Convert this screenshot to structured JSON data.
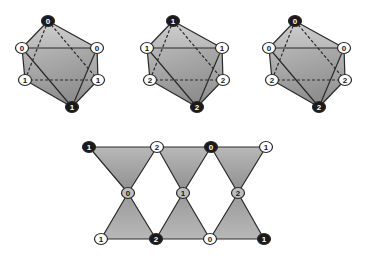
{
  "colors": {
    "background": "#ffffff",
    "edge": "#2a2a2a",
    "face_light": "#c9c9c9",
    "face_mid": "#a8a8a8",
    "face_dark": "#858585",
    "node_black": "#1a1a1a",
    "node_white": "#ffffff",
    "node_gray": "#bdbdbd"
  },
  "octahedra": [
    {
      "name": "octahedron-1",
      "offset_x": 0,
      "vertices": {
        "top": {
          "label": "0",
          "style": "black",
          "x": 48,
          "y": 21
        },
        "upper_left": {
          "label": "0",
          "style": "white",
          "x": 22,
          "y": 48
        },
        "upper_right": {
          "label": "0",
          "style": "white",
          "x": 97,
          "y": 48
        },
        "lower_left": {
          "label": "1",
          "style": "white",
          "x": 25,
          "y": 80
        },
        "lower_right": {
          "label": "1",
          "style": "white",
          "x": 98,
          "y": 80
        },
        "bottom": {
          "label": "1",
          "style": "black",
          "x": 72,
          "y": 107
        }
      }
    },
    {
      "name": "octahedron-2",
      "offset_x": 125,
      "vertices": {
        "top": {
          "label": "1",
          "style": "black",
          "x": 48,
          "y": 21
        },
        "upper_left": {
          "label": "1",
          "style": "white",
          "x": 22,
          "y": 48
        },
        "upper_right": {
          "label": "1",
          "style": "white",
          "x": 97,
          "y": 48
        },
        "lower_left": {
          "label": "2",
          "style": "white",
          "x": 25,
          "y": 80
        },
        "lower_right": {
          "label": "2",
          "style": "white",
          "x": 98,
          "y": 80
        },
        "bottom": {
          "label": "2",
          "style": "black",
          "x": 72,
          "y": 107
        }
      }
    },
    {
      "name": "octahedron-3",
      "offset_x": 247,
      "vertices": {
        "top": {
          "label": "0",
          "style": "black",
          "x": 48,
          "y": 21
        },
        "upper_left": {
          "label": "0",
          "style": "white",
          "x": 22,
          "y": 48
        },
        "upper_right": {
          "label": "0",
          "style": "white",
          "x": 97,
          "y": 48
        },
        "lower_left": {
          "label": "2",
          "style": "white",
          "x": 25,
          "y": 80
        },
        "lower_right": {
          "label": "2",
          "style": "white",
          "x": 98,
          "y": 80
        },
        "bottom": {
          "label": "2",
          "style": "black",
          "x": 72,
          "y": 107
        }
      }
    }
  ],
  "chain": {
    "name": "bowtie-chain",
    "top_row": [
      {
        "label": "1",
        "style": "black",
        "x": 89,
        "y": 147
      },
      {
        "label": "2",
        "style": "white",
        "x": 157,
        "y": 147
      },
      {
        "label": "0",
        "style": "black",
        "x": 211,
        "y": 147
      },
      {
        "label": "1",
        "style": "white",
        "x": 266,
        "y": 147
      }
    ],
    "middle_row": [
      {
        "label": "0",
        "style": "gray",
        "x": 128,
        "y": 193
      },
      {
        "label": "1",
        "style": "gray",
        "x": 183,
        "y": 193
      },
      {
        "label": "2",
        "style": "gray",
        "x": 238,
        "y": 193
      }
    ],
    "bottom_row": [
      {
        "label": "1",
        "style": "white",
        "x": 101,
        "y": 239
      },
      {
        "label": "2",
        "style": "black",
        "x": 156,
        "y": 239
      },
      {
        "label": "0",
        "style": "white",
        "x": 210,
        "y": 239
      },
      {
        "label": "1",
        "style": "black",
        "x": 264,
        "y": 239
      }
    ]
  }
}
